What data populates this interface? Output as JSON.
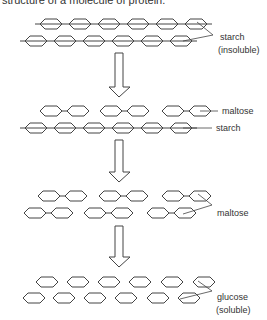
{
  "caption": "structure of a molecule of protein.",
  "labels": {
    "starch_insoluble_1": "starch",
    "starch_insoluble_2": "(insoluble)",
    "maltose_1": "maltose",
    "starch_2": "starch",
    "maltose_2": "maltose",
    "glucose_1": "glucose",
    "glucose_2": "(soluble)"
  },
  "stages": [
    {
      "name": "starch chains",
      "rows": [
        {
          "y": 24,
          "chain": true,
          "start": 40,
          "count": 6
        },
        {
          "y": 41,
          "chain": true,
          "start": 25,
          "count": 6
        }
      ]
    },
    {
      "name": "maltose + starch",
      "rows": [
        {
          "y": 111,
          "pairs": [
            40,
            100,
            162
          ]
        },
        {
          "y": 128,
          "chain": true,
          "start": 25,
          "count": 6
        }
      ]
    },
    {
      "name": "maltose",
      "rows": [
        {
          "y": 196,
          "pairs": [
            38,
            99,
            162
          ]
        },
        {
          "y": 213,
          "pairs": [
            24,
            84,
            147
          ]
        }
      ]
    },
    {
      "name": "glucose",
      "rows": [
        {
          "y": 282,
          "singles": [
            36,
            67,
            98,
            129,
            161,
            193
          ]
        },
        {
          "y": 298,
          "singles": [
            23,
            53,
            84,
            115,
            147,
            178
          ]
        }
      ]
    }
  ],
  "arrows": [
    {
      "top": 53,
      "tip": 97
    },
    {
      "top": 140,
      "tip": 182
    },
    {
      "top": 226,
      "tip": 267
    }
  ]
}
